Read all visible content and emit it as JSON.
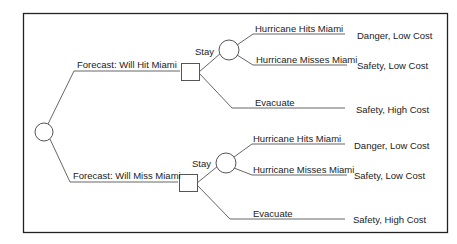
{
  "diagram": {
    "type": "decision-tree",
    "frame": {
      "x": 23,
      "y": 13,
      "w": 424,
      "h": 219
    },
    "line_color": "#555555",
    "text_color": "#222222",
    "root": {
      "type": "chance",
      "cx": 44,
      "cy": 132,
      "r": 9
    },
    "branches": [
      {
        "label": "Forecast: Will Hit Miami",
        "decision_node": {
          "x": 181,
          "y": 63,
          "w": 18,
          "h": 17
        },
        "options": [
          {
            "label": "Stay",
            "chance_node": {
              "cx": 229,
              "cy": 50,
              "r": 10
            },
            "outcomes": [
              {
                "label": "Hurricane Hits Miami",
                "result": "Danger, Low Cost"
              },
              {
                "label": "Hurricane Misses Miami",
                "result": "Safety, Low Cost"
              }
            ]
          },
          {
            "label": "Evacuate",
            "result": "Safety, High Cost"
          }
        ]
      },
      {
        "label": "Forecast: Will Miss Miami",
        "decision_node": {
          "x": 179,
          "y": 174,
          "w": 18,
          "h": 17
        },
        "options": [
          {
            "label": "Stay",
            "chance_node": {
              "cx": 226,
              "cy": 163,
              "r": 10
            },
            "outcomes": [
              {
                "label": "Hurricane Hits Miami",
                "result": "Danger, Low Cost"
              },
              {
                "label": "Hurricane Misses Miami",
                "result": "Safety, Low Cost"
              }
            ]
          },
          {
            "label": "Evacuate",
            "result": "Safety, High Cost"
          }
        ]
      }
    ]
  }
}
